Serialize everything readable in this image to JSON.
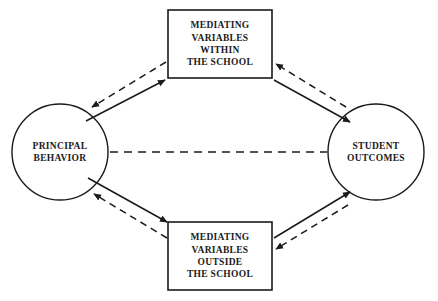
{
  "diagram": {
    "background_color": "#ffffff",
    "stroke_color": "#1a1a1a",
    "text_color": "#1a1a1a",
    "nodes": {
      "principal_behavior": {
        "shape": "ellipse",
        "lines": [
          "PRINCIPAL",
          "BEHAVIOR"
        ]
      },
      "student_outcomes": {
        "shape": "ellipse",
        "lines": [
          "STUDENT",
          "OUTCOMES"
        ]
      },
      "mediating_within": {
        "shape": "rectangle",
        "lines": [
          "MEDIATING",
          "VARIABLES",
          "WITHIN",
          "THE SCHOOL"
        ]
      },
      "mediating_outside": {
        "shape": "rectangle",
        "lines": [
          "MEDIATING",
          "VARIABLES",
          "OUTSIDE",
          "THE SCHOOL"
        ]
      }
    },
    "edges": [
      {
        "name": "principal-to-mediating-within",
        "from": "principal_behavior",
        "to": "mediating_within",
        "style": "solid",
        "arrow": "end"
      },
      {
        "name": "mediating-within-to-principal",
        "from": "mediating_within",
        "to": "principal_behavior",
        "style": "dashed",
        "arrow": "end"
      },
      {
        "name": "mediating-within-to-student",
        "from": "mediating_within",
        "to": "student_outcomes",
        "style": "solid",
        "arrow": "end"
      },
      {
        "name": "student-to-mediating-within",
        "from": "student_outcomes",
        "to": "mediating_within",
        "style": "dashed",
        "arrow": "end"
      },
      {
        "name": "principal-to-mediating-outside",
        "from": "principal_behavior",
        "to": "mediating_outside",
        "style": "solid",
        "arrow": "end"
      },
      {
        "name": "mediating-outside-to-principal",
        "from": "mediating_outside",
        "to": "principal_behavior",
        "style": "dashed",
        "arrow": "end"
      },
      {
        "name": "mediating-outside-to-student",
        "from": "mediating_outside",
        "to": "student_outcomes",
        "style": "solid",
        "arrow": "end"
      },
      {
        "name": "student-to-mediating-outside",
        "from": "student_outcomes",
        "to": "mediating_outside",
        "style": "dashed",
        "arrow": "end"
      },
      {
        "name": "principal-to-student-direct",
        "from": "principal_behavior",
        "to": "student_outcomes",
        "style": "dashed",
        "arrow": "none"
      }
    ]
  }
}
